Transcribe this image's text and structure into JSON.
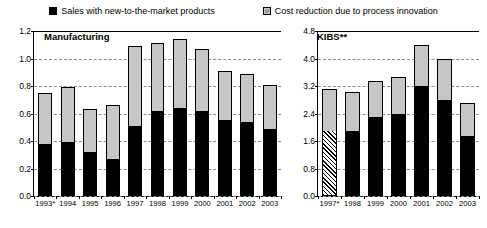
{
  "legend": {
    "items": [
      {
        "label": "Sales with new-to-the-market products",
        "swatch": "black-square-icon"
      },
      {
        "label": "Cost reduction due to process innovation",
        "swatch": "grey-square-icon"
      }
    ]
  },
  "chart_data": [
    {
      "type": "bar",
      "title": "Manufacturing",
      "stacked": true,
      "xlabel": "",
      "ylabel": "",
      "ylim": [
        0,
        1.2
      ],
      "yticks": [
        0.0,
        0.2,
        0.4,
        0.6,
        0.8,
        1.0,
        1.2
      ],
      "ytick_labels": [
        "0.0",
        "0.2",
        "0.4",
        "0.6",
        "0.8",
        "1.0",
        "1.2"
      ],
      "grid": true,
      "legend_position": "top",
      "categories": [
        "1993*",
        "1994",
        "1995",
        "1996",
        "1997",
        "1998",
        "1999",
        "2000",
        "2001",
        "2002",
        "2003"
      ],
      "series": [
        {
          "name": "Sales with new-to-the-market products",
          "color": "#000000",
          "values": [
            0.38,
            0.39,
            0.32,
            0.27,
            0.51,
            0.62,
            0.64,
            0.62,
            0.55,
            0.54,
            0.49
          ]
        },
        {
          "name": "Cost reduction due to process innovation",
          "color": "#c6c6c6",
          "values": [
            0.37,
            0.4,
            0.31,
            0.39,
            0.58,
            0.49,
            0.5,
            0.45,
            0.36,
            0.35,
            0.32
          ]
        }
      ],
      "totals": [
        0.75,
        0.79,
        0.63,
        0.66,
        1.09,
        1.11,
        1.14,
        1.07,
        0.91,
        0.89,
        0.81
      ]
    },
    {
      "type": "bar",
      "title": "KIBS**",
      "stacked": true,
      "xlabel": "",
      "ylabel": "",
      "ylim": [
        0,
        4.8
      ],
      "yticks": [
        0.0,
        0.8,
        1.6,
        2.4,
        3.2,
        4.0,
        4.8
      ],
      "ytick_labels": [
        "0.0",
        "0.8",
        "1.6",
        "2.4",
        "3.2",
        "4.0",
        "4.8"
      ],
      "grid": true,
      "legend_position": "top",
      "categories": [
        "1997*",
        "1998",
        "1999",
        "2000",
        "2001",
        "2002",
        "2003"
      ],
      "series": [
        {
          "name": "Sales with new-to-the-market products",
          "color": "#000000",
          "values": [
            1.88,
            1.9,
            2.3,
            2.4,
            3.2,
            2.8,
            1.75
          ],
          "hatched_indices": [
            0
          ]
        },
        {
          "name": "Cost reduction due to process innovation",
          "color": "#c6c6c6",
          "values": [
            1.24,
            1.12,
            1.05,
            1.05,
            1.2,
            1.2,
            0.95
          ]
        }
      ],
      "totals": [
        3.12,
        3.02,
        3.35,
        3.45,
        4.4,
        4.0,
        2.7
      ]
    }
  ]
}
